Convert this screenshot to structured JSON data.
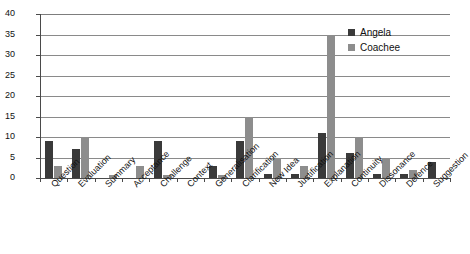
{
  "chart_data": {
    "type": "bar",
    "title": "",
    "subtitle": "",
    "xlabel": "",
    "ylabel": "",
    "ylim": [
      0,
      40
    ],
    "ytick_step": 5,
    "yticks": [
      "0",
      "5",
      "10",
      "15",
      "20",
      "25",
      "30",
      "35",
      "40"
    ],
    "grid": true,
    "legend_position": "top-right",
    "categories": [
      "Question",
      "Evaluation",
      "Summary",
      "Acceptance",
      "Challenge",
      "Context",
      "Generalisation",
      "Clarification",
      "New Idea",
      "Justification",
      "Explanation",
      "Continuity",
      "Dissonance",
      "Defence",
      "Suggestion"
    ],
    "series": [
      {
        "name": "Angela",
        "color": "#3a3a3a",
        "values": [
          9,
          7,
          0,
          0,
          9,
          0,
          3,
          9,
          1,
          1,
          11,
          6,
          1,
          1,
          4
        ]
      },
      {
        "name": "Coachee",
        "color": "#8d8d8d",
        "values": [
          3,
          10,
          0.7,
          3,
          0.7,
          0,
          0.7,
          15,
          5,
          3,
          35,
          10,
          5,
          2,
          0
        ]
      }
    ]
  },
  "legend": {
    "items": [
      {
        "label": "Angela",
        "color": "#3a3a3a"
      },
      {
        "label": "Coachee",
        "color": "#8d8d8d"
      }
    ]
  },
  "axes": {
    "y_max_label": "40",
    "y_min_label": "0"
  }
}
